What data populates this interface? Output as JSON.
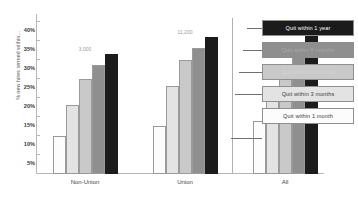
{
  "chart": {
    "type": "bar",
    "title": "",
    "ylabel": "% new hires termed within…"
  },
  "chart_data": {
    "type": "bar",
    "title": "",
    "subtitle": "",
    "xlabel": "",
    "ylabel": "% new hires termed within…",
    "ylim": [
      0,
      42
    ],
    "ytick_labels": [
      "40%",
      "35%",
      "30%",
      "25%",
      "20%",
      "15%",
      "10%",
      "5%"
    ],
    "ytick_values": [
      40,
      35,
      30,
      25,
      20,
      15,
      10,
      5
    ],
    "grid": false,
    "legend_position": "right",
    "categories": [
      "Non-Union",
      "Union",
      "All"
    ],
    "category_annotations": [
      "3,000",
      "11,200",
      "14,000"
    ],
    "series": [
      {
        "name": "Quit within 1 month",
        "color": "#fcfcfc",
        "values": [
          10.0,
          12.5,
          14.0
        ]
      },
      {
        "name": "Quit within 3 months",
        "color": "#e3e3e3",
        "values": [
          18.0,
          23.0,
          22.0
        ]
      },
      {
        "name": "Quit within 6 months",
        "color": "#c9c9c9",
        "values": [
          25.0,
          30.0,
          28.5
        ]
      },
      {
        "name": "Quit within 9 months",
        "color": "#8f8f8f",
        "values": [
          28.5,
          33.0,
          32.0
        ]
      },
      {
        "name": "Quit within 1 year",
        "color": "#1b1b1b",
        "values": [
          31.5,
          36.0,
          36.5
        ]
      }
    ]
  },
  "legend": {
    "items": [
      {
        "label": "Quit within 1 year",
        "bg": "#1b1b1b",
        "fg": "#ffffff"
      },
      {
        "label": "Quit within 9 months",
        "bg": "#8f8f8f",
        "fg": "#a8a8a8"
      },
      {
        "label": "Quit within 6 months",
        "bg": "#c9c9c9",
        "fg": "#d4d4d4"
      },
      {
        "label": "Quit within 3 months",
        "bg": "#e3e3e3",
        "fg": "#3a3a3a"
      },
      {
        "label": "Quit within 1 month",
        "bg": "#fcfcfc",
        "fg": "#3a3a3a"
      }
    ]
  }
}
